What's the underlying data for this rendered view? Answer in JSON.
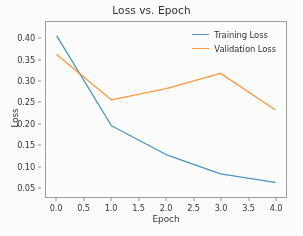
{
  "chart_data": {
    "type": "line",
    "title": "Loss vs. Epoch",
    "xlabel": "Epoch",
    "ylabel": "Loss",
    "x": [
      0.0,
      1.0,
      2.0,
      3.0,
      4.0
    ],
    "series": [
      {
        "name": "Training Loss",
        "color": "#1f77b4",
        "values": [
          0.407,
          0.195,
          0.127,
          0.081,
          0.061
        ]
      },
      {
        "name": "Validation Loss",
        "color": "#ff7f0e",
        "values": [
          0.363,
          0.256,
          0.283,
          0.319,
          0.233
        ]
      }
    ],
    "xlim": [
      -0.2,
      4.2
    ],
    "ylim": [
      0.0265,
      0.4405
    ],
    "xticks": [
      0.0,
      0.5,
      1.0,
      1.5,
      2.0,
      2.5,
      3.0,
      3.5,
      4.0
    ],
    "xtick_labels": [
      "0.0",
      "0.5",
      "1.0",
      "1.5",
      "2.0",
      "2.5",
      "3.0",
      "3.5",
      "4.0"
    ],
    "yticks": [
      0.05,
      0.1,
      0.15,
      0.2,
      0.25,
      0.3,
      0.35,
      0.4
    ],
    "ytick_labels": [
      "0.05",
      "0.10",
      "0.15",
      "0.20",
      "0.25",
      "0.30",
      "0.35",
      "0.40"
    ],
    "grid": false,
    "legend_position": "upper right"
  }
}
